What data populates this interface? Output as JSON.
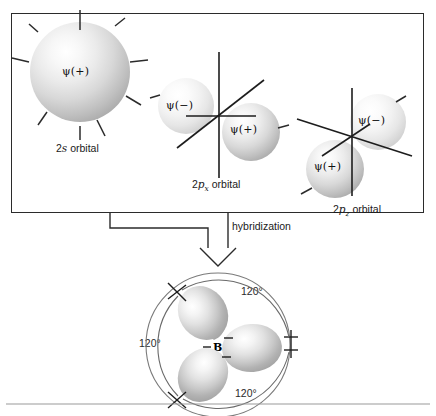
{
  "figure": {
    "title_present": false,
    "atomic_orbitals_box": {
      "orbitals": [
        {
          "id": "2s",
          "caption_prefix": "2",
          "caption_symbol": "s",
          "caption_subscript": "",
          "caption_suffix": " orbital",
          "caption_full": "2s orbital",
          "lobes": [
            {
              "sign": "+",
              "label": "ψ(+)",
              "shade": "dark"
            }
          ]
        },
        {
          "id": "2px",
          "caption_prefix": "2",
          "caption_symbol": "p",
          "caption_subscript": "x",
          "caption_suffix": " orbital",
          "caption_full": "2px orbital",
          "lobes": [
            {
              "sign": "-",
              "label": "ψ(−)",
              "shade": "pale"
            },
            {
              "sign": "+",
              "label": "ψ(+)",
              "shade": "dark"
            }
          ]
        },
        {
          "id": "2pz",
          "caption_prefix": "2",
          "caption_symbol": "p",
          "caption_subscript": "z",
          "caption_suffix": " orbital",
          "caption_full": "2pz orbital",
          "lobes": [
            {
              "sign": "-",
              "label": "ψ(−)",
              "shade": "pale"
            },
            {
              "sign": "+",
              "label": "ψ(+)",
              "shade": "dark"
            }
          ]
        }
      ]
    },
    "transition": {
      "arrow_label": "hybridization",
      "direction": "down"
    },
    "hybrid_result": {
      "central_atom": "B",
      "lobes": [
        {
          "label": "ψ(+)",
          "position": "upper-left"
        },
        {
          "label": "ψ(+)",
          "position": "right"
        },
        {
          "label": "ψ(+)",
          "position": "lower-left"
        }
      ],
      "angles": [
        {
          "value": "120°",
          "position": "upper-right"
        },
        {
          "value": "120°",
          "position": "left"
        },
        {
          "value": "120°",
          "position": "bottom-right"
        }
      ]
    },
    "colors": {
      "frame": "#2b2b2b",
      "axis": "#1d1d1d",
      "arc": "#6a6a6a",
      "rule": "#9a9a9a",
      "text": "#1a1a1a"
    }
  }
}
